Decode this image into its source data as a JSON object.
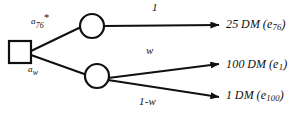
{
  "diagram": {
    "type": "decision-tree",
    "stroke_color": "#101010",
    "background_color": "#ffffff",
    "nodes": [
      {
        "id": "decision",
        "shape": "square",
        "label": ""
      },
      {
        "id": "chance-top",
        "shape": "circle",
        "label": ""
      },
      {
        "id": "chance-bottom",
        "shape": "circle",
        "label": ""
      }
    ],
    "action_labels": {
      "top": {
        "base": "a",
        "subscript": "76",
        "superscript": "*",
        "text": "a76*"
      },
      "bottom": {
        "base": "a",
        "subscript": "w",
        "superscript": "",
        "text": "aw"
      }
    },
    "probability_labels": {
      "top": "1",
      "middle": "w",
      "bottom": "1-w"
    },
    "outcomes": [
      {
        "amount": "25",
        "currency": "DM",
        "event_base": "e",
        "event_sub": "76"
      },
      {
        "amount": "100",
        "currency": "DM",
        "event_base": "e",
        "event_sub": "1"
      },
      {
        "amount": "1",
        "currency": "DM",
        "event_base": "e",
        "event_sub": "100"
      }
    ]
  }
}
